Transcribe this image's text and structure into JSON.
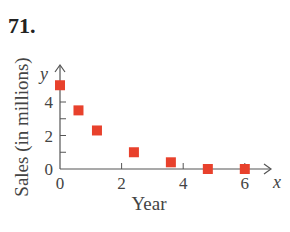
{
  "problem": {
    "number": "71."
  },
  "chart_data": {
    "type": "scatter",
    "title": "",
    "xlabel": "Year",
    "ylabel": "Sales (in millions)",
    "x_axis_symbol": "x",
    "y_axis_symbol": "y",
    "xlim": [
      0,
      6.8
    ],
    "ylim": [
      0,
      5.5
    ],
    "x_ticks": [
      0,
      2,
      4,
      6
    ],
    "y_ticks": [
      0,
      2,
      4
    ],
    "y_minor_ticks": [
      1,
      3
    ],
    "grid": false,
    "legend": null,
    "marker": "square",
    "marker_color": "#e8412c",
    "series": [
      {
        "name": "Sales",
        "x": [
          0,
          0.6,
          1.2,
          2.4,
          3.6,
          4.8,
          6.0
        ],
        "y": [
          5.0,
          3.5,
          2.3,
          1.0,
          0.4,
          0.0,
          0.0
        ]
      }
    ]
  }
}
